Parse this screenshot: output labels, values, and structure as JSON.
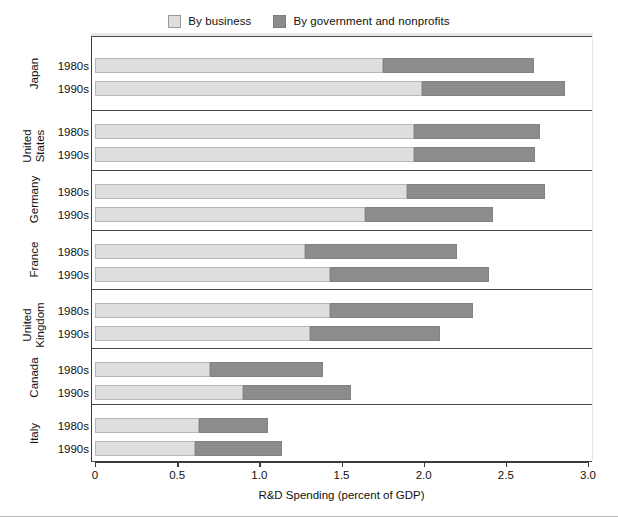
{
  "legend": {
    "entries": [
      {
        "label": "By business",
        "color": "#dedede",
        "key": "business"
      },
      {
        "label": "By government and nonprofits",
        "color": "#8c8c8c",
        "key": "government"
      }
    ]
  },
  "axis": {
    "x_title": "R&D Spending (percent of GDP)",
    "x_ticks": [
      "0",
      "0.5",
      "1.0",
      "1.5",
      "2.0",
      "2.5",
      "3.0"
    ]
  },
  "periods": {
    "p1980s": "1980s",
    "p1990s": "1990s"
  },
  "countries": {
    "japan": "Japan",
    "united_states": "United\nStates",
    "germany": "Germany",
    "france": "France",
    "united_kingdom": "United\nKingdom",
    "canada": "Canada",
    "italy": "Italy"
  },
  "chart_data": {
    "type": "bar",
    "orientation": "horizontal",
    "stacked": true,
    "title": "",
    "xlabel": "R&D Spending (percent of GDP)",
    "ylabel": "",
    "xlim": [
      0,
      3.0
    ],
    "xticks": [
      0,
      0.5,
      1.0,
      1.5,
      2.0,
      2.5,
      3.0
    ],
    "grid": false,
    "legend_position": "top-center",
    "categories": [
      "Japan 1980s",
      "Japan 1990s",
      "United States 1980s",
      "United States 1990s",
      "Germany 1980s",
      "Germany 1990s",
      "France 1980s",
      "France 1990s",
      "United Kingdom 1980s",
      "United Kingdom 1990s",
      "Canada 1980s",
      "Canada 1990s",
      "Italy 1980s",
      "Italy 1990s"
    ],
    "series": [
      {
        "name": "By business",
        "color": "#dedede",
        "values": [
          1.75,
          1.99,
          1.94,
          1.94,
          1.9,
          1.64,
          1.28,
          1.43,
          1.43,
          1.31,
          0.7,
          0.9,
          0.63,
          0.61
        ]
      },
      {
        "name": "By government and nonprofits",
        "color": "#8c8c8c",
        "values": [
          0.92,
          0.87,
          0.77,
          0.74,
          0.84,
          0.78,
          0.92,
          0.97,
          0.87,
          0.79,
          0.69,
          0.66,
          0.42,
          0.53
        ]
      }
    ],
    "totals": [
      2.67,
      2.86,
      2.71,
      2.68,
      2.74,
      2.42,
      2.2,
      2.4,
      2.3,
      2.1,
      1.39,
      1.56,
      1.05,
      1.14
    ],
    "groups": [
      {
        "country": "Japan",
        "rows": [
          {
            "period": "1980s",
            "business": 1.75,
            "government": 0.92,
            "total": 2.67
          },
          {
            "period": "1990s",
            "business": 1.99,
            "government": 0.87,
            "total": 2.86
          }
        ]
      },
      {
        "country": "United States",
        "rows": [
          {
            "period": "1980s",
            "business": 1.94,
            "government": 0.77,
            "total": 2.71
          },
          {
            "period": "1990s",
            "business": 1.94,
            "government": 0.74,
            "total": 2.68
          }
        ]
      },
      {
        "country": "Germany",
        "rows": [
          {
            "period": "1980s",
            "business": 1.9,
            "government": 0.84,
            "total": 2.74
          },
          {
            "period": "1990s",
            "business": 1.64,
            "government": 0.78,
            "total": 2.42
          }
        ]
      },
      {
        "country": "France",
        "rows": [
          {
            "period": "1980s",
            "business": 1.28,
            "government": 0.92,
            "total": 2.2
          },
          {
            "period": "1990s",
            "business": 1.43,
            "government": 0.97,
            "total": 2.4
          }
        ]
      },
      {
        "country": "United Kingdom",
        "rows": [
          {
            "period": "1980s",
            "business": 1.43,
            "government": 0.87,
            "total": 2.3
          },
          {
            "period": "1990s",
            "business": 1.31,
            "government": 0.79,
            "total": 2.1
          }
        ]
      },
      {
        "country": "Canada",
        "rows": [
          {
            "period": "1980s",
            "business": 0.7,
            "government": 0.69,
            "total": 1.39
          },
          {
            "period": "1990s",
            "business": 0.9,
            "government": 0.66,
            "total": 1.56
          }
        ]
      },
      {
        "country": "Italy",
        "rows": [
          {
            "period": "1980s",
            "business": 0.63,
            "government": 0.42,
            "total": 1.05
          },
          {
            "period": "1990s",
            "business": 0.61,
            "government": 0.53,
            "total": 1.14
          }
        ]
      }
    ]
  },
  "geometry": {
    "x0_px": 95,
    "x_max_px": 588,
    "plot_top_px": 36,
    "group_height_px": 58.5,
    "first_group_top_px": 44,
    "bar_height_px": 15,
    "bar_gap_px": 20
  }
}
